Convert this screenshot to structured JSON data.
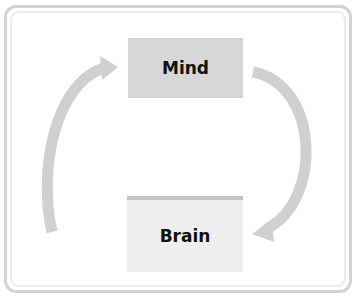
{
  "diagram": {
    "nodes": [
      {
        "id": "mind",
        "label": "Mind"
      },
      {
        "id": "brain",
        "label": "Brain"
      }
    ],
    "edges": [
      {
        "from": "brain",
        "to": "mind",
        "side": "left"
      },
      {
        "from": "mind",
        "to": "brain",
        "side": "right"
      }
    ],
    "colors": {
      "mind_fill": "#d7d7d7",
      "brain_fill": "#eeeeee",
      "arrow": "#d0d0d0",
      "frame": "#d3d3d3"
    }
  }
}
